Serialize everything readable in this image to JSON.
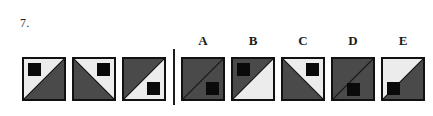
{
  "question": {
    "number": "7.",
    "type": "matrix-reasoning-sequence"
  },
  "colors": {
    "light": "#ececec",
    "dark": "#4a4a4a",
    "black": "#0a0a0a",
    "border": "#111111",
    "page_background": "#ffffff",
    "divider": "#1d1d1d"
  },
  "divider": {
    "present": true,
    "orientation": "vertical",
    "x": 173
  },
  "sequence": {
    "label": "stem-sequence",
    "cells": [
      {
        "name": "stem-cell-1",
        "x": 22,
        "diagonal": "bl-tr",
        "upper_left_fill": "light",
        "lower_right_fill": "dark",
        "square_position": "top-left"
      },
      {
        "name": "stem-cell-2",
        "x": 72,
        "diagonal": "tl-br",
        "upper_right_fill": "light",
        "lower_left_fill": "dark",
        "square_position": "top-right"
      },
      {
        "name": "stem-cell-3",
        "x": 122,
        "diagonal": "bl-tr",
        "upper_left_fill": "dark",
        "lower_right_fill": "light",
        "square_position": "bottom-right"
      }
    ]
  },
  "options": {
    "label": "answer-options",
    "items": [
      {
        "letter": "A",
        "name": "option-a",
        "x": 181,
        "label_x": 181,
        "diagonal": "bl-tr",
        "upper_left_fill": "dark",
        "lower_right_fill": "dark",
        "square_position": "bottom-right"
      },
      {
        "letter": "B",
        "name": "option-b",
        "x": 231,
        "label_x": 231,
        "diagonal": "bl-tr",
        "upper_left_fill": "dark",
        "lower_right_fill": "light",
        "square_position": "top-left"
      },
      {
        "letter": "C",
        "name": "option-c",
        "x": 281,
        "label_x": 281,
        "diagonal": "tl-br",
        "upper_right_fill": "light",
        "lower_left_fill": "dark",
        "square_position": "top-right"
      },
      {
        "letter": "D",
        "name": "option-d",
        "x": 331,
        "label_x": 331,
        "diagonal": "bl-tr",
        "upper_left_fill": "dark",
        "lower_right_fill": "dark",
        "square_position": "bottom-center"
      },
      {
        "letter": "E",
        "name": "option-e",
        "x": 381,
        "label_x": 381,
        "diagonal": "bl-tr",
        "upper_left_fill": "light",
        "lower_right_fill": "dark",
        "square_position": "bottom-left"
      }
    ]
  }
}
